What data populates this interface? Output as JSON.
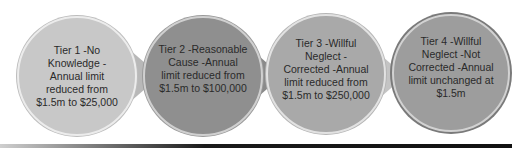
{
  "diagram": {
    "tiers": [
      {
        "label": "Tier 1 -No Knowledge -Annual limit reduced from $1.5m to $25,000",
        "lines": [
          "Tier 1 -No",
          "Knowledge -",
          "Annual limit",
          "reduced from",
          "$1.5m to $25,000"
        ],
        "fill": "#c8c8c8",
        "ring": "#e6e6e6"
      },
      {
        "label": "Tier 2 -Reasonable Cause -Annual limit reduced from $1.5m to $100,000",
        "lines": [
          "Tier 2 -Reasonable",
          "Cause -Annual",
          "limit reduced from",
          "$1.5m to $100,000"
        ],
        "fill": "#8f8f8f",
        "ring": "#bdbdbd"
      },
      {
        "label": "Tier 3 -Willful Neglect -Corrected -Annual limit reduced from $1.5m to $250,000",
        "lines": [
          "Tier 3 -Willful",
          "Neglect -",
          "Corrected -Annual",
          "limit reduced from",
          "$1.5m to $250,000"
        ],
        "fill": "#a9a9a9",
        "ring": "#d6d6d6"
      },
      {
        "label": "Tier 4 -Willful Neglect -Not Corrected -Annual limit unchanged at $1.5m",
        "lines": [
          "Tier 4 -Willful",
          "Neglect -Not",
          "Corrected -Annual",
          "limit unchanged at",
          "$1.5m"
        ],
        "fill": "#9d9d9d",
        "ring": "#7a7a7a"
      }
    ]
  }
}
